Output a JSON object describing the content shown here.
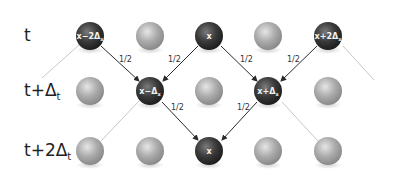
{
  "rows": [
    {
      "label": "t",
      "sub": ""
    },
    {
      "label": "t+Δ",
      "sub": "t"
    },
    {
      "label": "t+2Δ",
      "sub": "t"
    }
  ],
  "nodes": {
    "r0c0": {
      "text": "x−2Δ",
      "sub": "x"
    },
    "r0c2": {
      "text": "x",
      "sub": ""
    },
    "r0c4": {
      "text": "x+2Δ",
      "sub": "x"
    },
    "r1c1": {
      "text": "x−Δ",
      "sub": "x"
    },
    "r1c3": {
      "text": "x+Δ",
      "sub": "x"
    },
    "r2c2": {
      "text": "x",
      "sub": ""
    }
  },
  "probabilities": {
    "p1": "1/2",
    "p2": "1/2",
    "p3": "1/2",
    "p4": "1/2",
    "p5": "1/2",
    "p6": "1/2"
  },
  "colors": {
    "active_ball": "#3a3a3a",
    "inactive_ball": "#a8a8a8",
    "arrow": "#2a2a2a",
    "faint_line": "#c8c8c8"
  }
}
